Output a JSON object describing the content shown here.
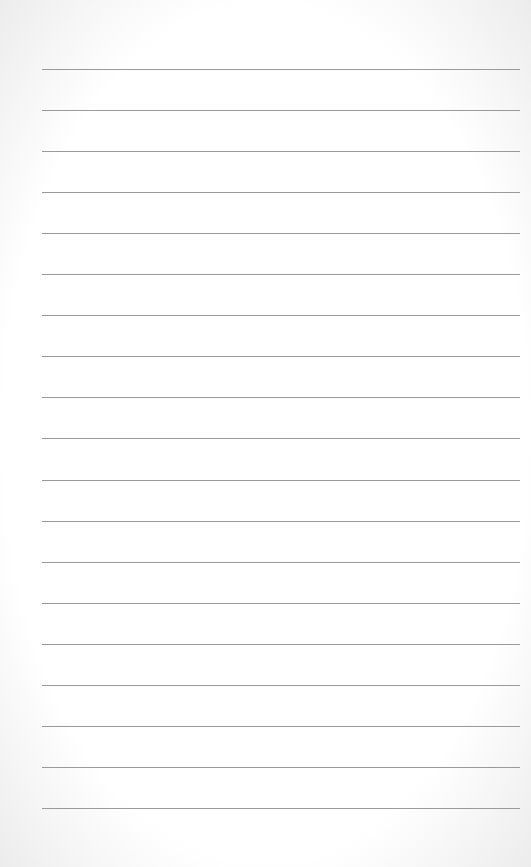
{
  "sheet": {
    "type": "lined-paper",
    "line_count": 19,
    "first_line_y": 69,
    "line_spacing": 41.05,
    "line_left": 42,
    "line_width": 478,
    "line_color": "#9a9a9a",
    "paper_color": "#ffffff"
  }
}
